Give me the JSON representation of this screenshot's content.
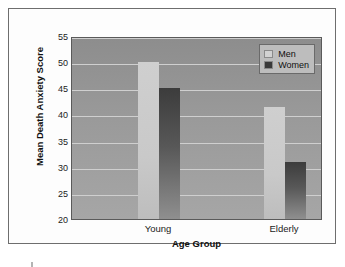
{
  "chart_data": {
    "type": "bar",
    "title": "",
    "xlabel": "Age Group",
    "ylabel": "Mean Death Anxiety Score",
    "categories": [
      "Young",
      "Elderly"
    ],
    "series": [
      {
        "name": "Men",
        "values": [
          50,
          41.5
        ],
        "color": "#cfcfcf"
      },
      {
        "name": "Women",
        "values": [
          45,
          31
        ],
        "color": "#3c3c3c"
      }
    ],
    "ylim": [
      20,
      55
    ],
    "yticks": [
      20,
      25,
      30,
      35,
      40,
      45,
      50,
      55
    ],
    "ytick_labels": [
      "20",
      "25",
      "30",
      "35",
      "40",
      "45",
      "50",
      "55"
    ],
    "grid": true,
    "legend_position": "top-right",
    "plot_background": "#9a9a9a",
    "gridline_color": "#cfcfcf"
  },
  "legend": {
    "entries": [
      {
        "label": "Men"
      },
      {
        "label": "Women"
      }
    ]
  },
  "axes": {
    "y_title": "Mean Death Anxiety Score",
    "x_title": "Age Group"
  }
}
